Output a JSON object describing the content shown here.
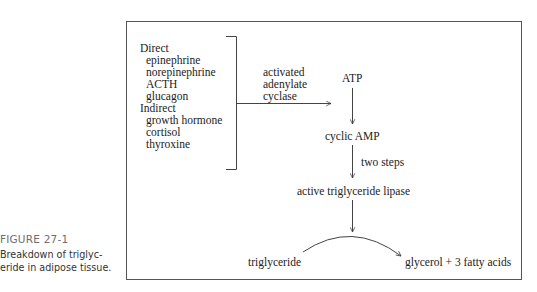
{
  "figure": {
    "number": "FIGURE 27-1",
    "caption_line1": "Breakdown of triglyc-",
    "caption_line2": "eride in adipose tissue."
  },
  "hormones": {
    "direct_label": "Direct",
    "direct": [
      "epinephrine",
      "norepinephrine",
      "ACTH",
      "glucagon"
    ],
    "indirect_label": "Indirect",
    "indirect": [
      "growth hormone",
      "cortisol",
      "thyroxine"
    ]
  },
  "pathway": {
    "enzyme_label": [
      "activated",
      "adenylate",
      "cyclase"
    ],
    "atp": "ATP",
    "cyclic_amp": "cyclic AMP",
    "two_steps": "two steps",
    "lipase": "active triglyceride lipase",
    "substrate": "triglyceride",
    "products": "glycerol + 3 fatty acids"
  },
  "colors": {
    "line": "#444444",
    "text": "#222222",
    "figure_number": "#6e6e6e"
  }
}
